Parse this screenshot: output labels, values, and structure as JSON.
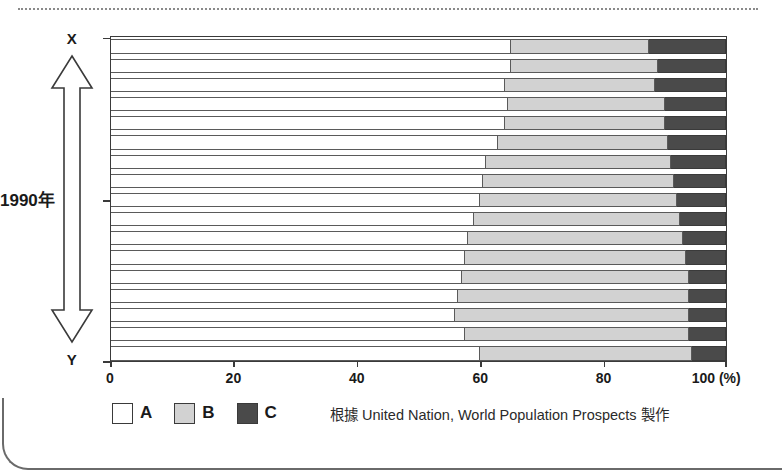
{
  "figure": {
    "axis_arrow": {
      "top_label": "X",
      "bottom_label": "Y",
      "middle_label": "1990年"
    },
    "source_note": "根據 United Nation, World Population Prospects 製作"
  },
  "colors": {
    "series_a": "#ffffff",
    "series_b": "#d2d2d2",
    "series_c": "#4a4a4a",
    "axis": "#3a3a3a"
  },
  "chart_data": {
    "type": "bar",
    "orientation": "horizontal",
    "stacked": true,
    "stack_mode": "percent",
    "title": "",
    "xlabel": "(%)",
    "ylabel": "",
    "xlim": [
      0,
      100
    ],
    "grid": false,
    "legend_position": "bottom-left",
    "xticks": [
      {
        "value": 0,
        "label": "0"
      },
      {
        "value": 20,
        "label": "20"
      },
      {
        "value": 40,
        "label": "40"
      },
      {
        "value": 60,
        "label": "60"
      },
      {
        "value": 80,
        "label": "80"
      },
      {
        "value": 100,
        "label": "100 (%)"
      }
    ],
    "legend": [
      {
        "key": "A",
        "label": "A",
        "color": "#ffffff"
      },
      {
        "key": "B",
        "label": "B",
        "color": "#d2d2d2"
      },
      {
        "key": "C",
        "label": "C",
        "color": "#4a4a4a"
      }
    ],
    "series": [
      {
        "name": "A",
        "values": [
          65.0,
          65.0,
          64.0,
          64.5,
          64.0,
          63.0,
          61.0,
          60.5,
          60.0,
          59.0,
          58.0,
          57.5,
          57.0,
          56.5,
          56.0,
          57.5,
          60.0
        ]
      },
      {
        "name": "B",
        "values": [
          22.5,
          24.0,
          24.5,
          25.5,
          26.0,
          27.5,
          30.0,
          31.0,
          32.0,
          33.5,
          35.0,
          36.0,
          37.0,
          37.5,
          38.0,
          36.5,
          34.5
        ]
      },
      {
        "name": "C",
        "values": [
          12.5,
          11.0,
          11.5,
          10.0,
          10.0,
          9.5,
          9.0,
          8.5,
          8.0,
          7.5,
          7.0,
          6.5,
          6.0,
          6.0,
          6.0,
          6.0,
          5.5
        ]
      }
    ],
    "categories": [
      "1",
      "2",
      "3",
      "4",
      "5",
      "6",
      "7",
      "8",
      "9",
      "10",
      "11",
      "12",
      "13",
      "14",
      "15",
      "16",
      "17"
    ],
    "annotations": [
      {
        "text": "X",
        "position": "axis-top"
      },
      {
        "text": "1990年",
        "position": "axis-middle"
      },
      {
        "text": "Y",
        "position": "axis-bottom"
      }
    ]
  }
}
